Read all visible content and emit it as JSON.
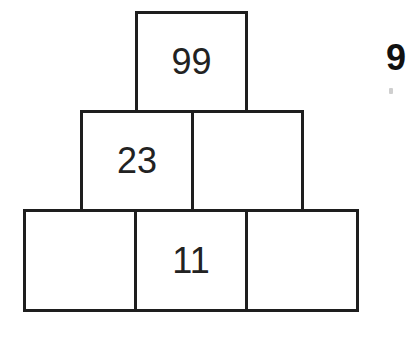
{
  "diagram": {
    "type": "number-pyramid",
    "rows": [
      {
        "row": "top",
        "bricks": [
          {
            "id": "top",
            "value": "99",
            "x": 135,
            "y": 11,
            "w": 113,
            "h": 102
          }
        ]
      },
      {
        "row": "middle",
        "bricks": [
          {
            "id": "middle-left",
            "value": "23",
            "x": 80,
            "y": 110,
            "w": 114,
            "h": 102
          },
          {
            "id": "middle-right",
            "value": "",
            "x": 191,
            "y": 110,
            "w": 113,
            "h": 102
          }
        ]
      },
      {
        "row": "bottom",
        "bricks": [
          {
            "id": "bottom-left",
            "value": "",
            "x": 23,
            "y": 209,
            "w": 114,
            "h": 103
          },
          {
            "id": "bottom-middle",
            "value": "11",
            "x": 134,
            "y": 209,
            "w": 114,
            "h": 103
          },
          {
            "id": "bottom-right",
            "value": "",
            "x": 245,
            "y": 209,
            "w": 114,
            "h": 103
          }
        ]
      }
    ],
    "border_color": "#1e1e1e",
    "text_color": "#222222"
  },
  "edge_text": {
    "partial_label": "9"
  }
}
